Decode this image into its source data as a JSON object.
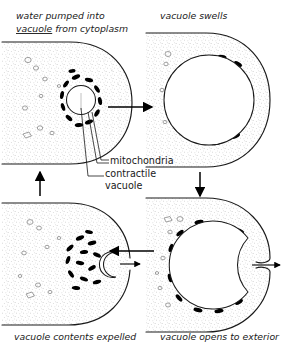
{
  "figure": {
    "background_color": "#ffffff",
    "ink_color": "#1a1a1a",
    "mitochondria_color": "#000000",
    "stipple_color": "#9a9a9a"
  },
  "captions": {
    "top_left_line1": "water pumped into",
    "top_left_line2_underlined": "vacuole",
    "top_left_line2_rest": " from cytoplasm",
    "top_right": "vacuole swells",
    "bottom_left": "vacuole contents expelled",
    "bottom_right": "vacuole opens to exterior"
  },
  "labels": {
    "mitochondria": "mitochondria",
    "contractile_line1": "contractile",
    "contractile_line2": "vacuole"
  },
  "panels": [
    {
      "id": "panel-top-left",
      "caption": "water pumped into vacuole from cytoplasm",
      "stage": 1,
      "vacuole_size": "small",
      "mitochondria_count": 12,
      "vesicle_count": 9,
      "vacuole_open": false
    },
    {
      "id": "panel-top-right",
      "caption": "vacuole swells",
      "stage": 2,
      "vacuole_size": "large",
      "mitochondria_count": 11,
      "vesicle_count": 4,
      "vacuole_open": false
    },
    {
      "id": "panel-bottom-left",
      "caption": "vacuole contents expelled",
      "stage": 4,
      "vacuole_size": "collapsed",
      "mitochondria_count": 13,
      "vesicle_count": 9,
      "vacuole_open": true
    },
    {
      "id": "panel-bottom-right",
      "caption": "vacuole opens to exterior",
      "stage": 3,
      "vacuole_size": "large",
      "mitochondria_count": 12,
      "vesicle_count": 7,
      "vacuole_open": true
    }
  ],
  "arrows": [
    {
      "id": "arrow-top",
      "direction": "right",
      "from": "panel-top-left",
      "to": "panel-top-right"
    },
    {
      "id": "arrow-right",
      "direction": "down",
      "from": "panel-top-right",
      "to": "panel-bottom-right"
    },
    {
      "id": "arrow-bottom",
      "direction": "left",
      "from": "panel-bottom-right",
      "to": "panel-bottom-left"
    },
    {
      "id": "arrow-left",
      "direction": "up",
      "from": "panel-bottom-left",
      "to": "panel-top-left"
    },
    {
      "id": "arrow-expel-left",
      "direction": "right",
      "note": "contents leaving cell"
    },
    {
      "id": "arrow-expel-right",
      "direction": "right",
      "note": "contents leaving cell"
    }
  ]
}
